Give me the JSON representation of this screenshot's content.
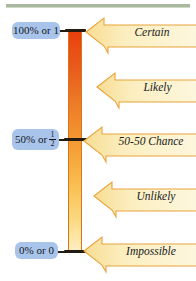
{
  "figure": {
    "top_rule_color": "#9aad8e",
    "bar": {
      "top_color": "#ea3d0d",
      "bottom_color": "#fdf0c8",
      "outline_color": "#d8751f"
    },
    "value_label_bg": "#a8c4ea",
    "arrow_fill_light": "#fdf3cf",
    "arrow_fill_dark": "#f8dd93",
    "arrow_outline": "#e8a33a"
  },
  "scale": {
    "values": [
      {
        "id": "certain-value",
        "text": "100% or 1",
        "percent": 100,
        "fraction": null
      },
      {
        "id": "half-value",
        "text": "50% or",
        "percent": 50,
        "fraction": {
          "numerator": "1",
          "denominator": "2"
        }
      },
      {
        "id": "zero-value",
        "text": "0% or 0",
        "percent": 0,
        "fraction": null
      }
    ]
  },
  "likelihoods": [
    {
      "id": "certain",
      "label": "Certain",
      "percent": 100
    },
    {
      "id": "likely",
      "label": "Likely",
      "percent": 75
    },
    {
      "id": "fifty-fifty",
      "label": "50-50 Chance",
      "percent": 50
    },
    {
      "id": "unlikely",
      "label": "Unlikely",
      "percent": 25
    },
    {
      "id": "impossible",
      "label": "Impossible",
      "percent": 0
    }
  ]
}
